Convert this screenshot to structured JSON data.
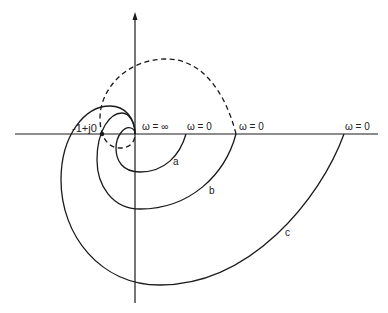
{
  "diagram": {
    "type": "nyquist-plot",
    "colors": {
      "line": "#1a1a1a",
      "background": "#ffffff"
    },
    "critical_point": {
      "label": "-1+j0"
    },
    "origin_label": "ω = ∞",
    "curves": [
      {
        "id": "a",
        "label": "a",
        "start_label": "ω = 0",
        "style": "solid"
      },
      {
        "id": "b",
        "label": "b",
        "start_label": "ω = 0",
        "style": "solid"
      },
      {
        "id": "c",
        "label": "c",
        "start_label": "ω = 0",
        "style": "solid"
      },
      {
        "id": "dashed",
        "label": "",
        "style": "dashed"
      }
    ]
  }
}
